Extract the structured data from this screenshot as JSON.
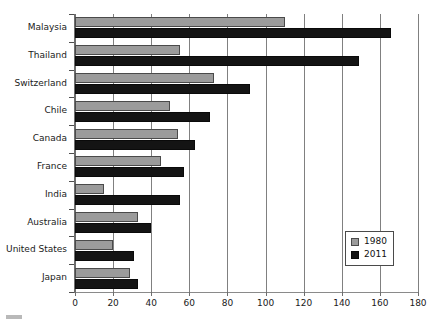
{
  "chart_data": {
    "type": "bar",
    "orientation": "horizontal",
    "title": "",
    "xlabel": "",
    "ylabel": "",
    "xlim": [
      0,
      180
    ],
    "xticks": [
      0,
      20,
      40,
      60,
      80,
      100,
      120,
      140,
      160,
      180
    ],
    "grid": true,
    "grid_axis": "x",
    "legend_position": "lower right",
    "categories": [
      "Malaysia",
      "Thailand",
      "Switzerland",
      "Chile",
      "Canada",
      "France",
      "India",
      "Australia",
      "United States",
      "Japan"
    ],
    "series": [
      {
        "name": "1980",
        "color": "#9b9b9b",
        "values": [
          110,
          55,
          73,
          50,
          54,
          45,
          15,
          33,
          20,
          29
        ]
      },
      {
        "name": "2011",
        "color": "#141414",
        "values": [
          166,
          149,
          92,
          71,
          63,
          57,
          55,
          40,
          31,
          33
        ]
      }
    ]
  },
  "legend": {
    "entries": [
      {
        "label": "1980",
        "swatch": "square-gray"
      },
      {
        "label": "2011",
        "swatch": "square-black"
      }
    ]
  }
}
